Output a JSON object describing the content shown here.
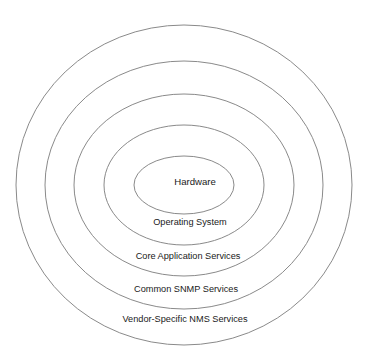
{
  "diagram": {
    "type": "concentric-layers",
    "background_color": "#ffffff",
    "stroke_color": "#8a8a8a",
    "text_color": "#1a1a1a",
    "center_x": 184,
    "center_y": 185,
    "layers": [
      {
        "id": "hardware",
        "label": "Hardware",
        "level": 1,
        "rx": 50,
        "ry": 29,
        "label_x": 195,
        "label_y": 182
      },
      {
        "id": "operating-system",
        "label": "Operating System",
        "level": 2,
        "rx": 80,
        "ry": 60,
        "label_x": 190,
        "label_y": 223
      },
      {
        "id": "core-application-services",
        "label": "Core Application Services",
        "level": 3,
        "rx": 110,
        "ry": 91,
        "label_x": 188,
        "label_y": 257
      },
      {
        "id": "common-snmp-services",
        "label": "Common SNMP Services",
        "level": 4,
        "rx": 139,
        "ry": 124,
        "label_x": 186,
        "label_y": 290
      },
      {
        "id": "vendor-specific-nms-services",
        "label": "Vendor-Specific NMS Services",
        "level": 5,
        "rx": 168,
        "ry": 160,
        "label_x": 185,
        "label_y": 320
      }
    ]
  }
}
